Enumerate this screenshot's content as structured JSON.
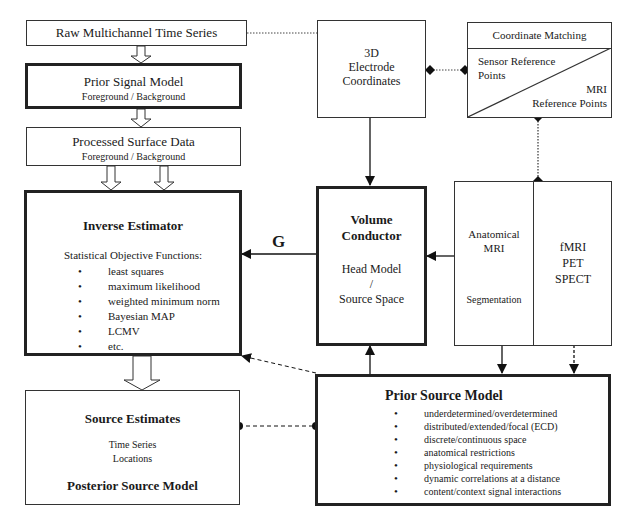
{
  "raw_series": {
    "label": "Raw Multichannel Time Series"
  },
  "prior_signal": {
    "title": "Prior Signal Model",
    "subtitle": "Foreground / Background"
  },
  "processed": {
    "title": "Processed Surface Data",
    "subtitle": "Foreground / Background"
  },
  "inverse": {
    "title": "Inverse Estimator",
    "subtitle": "Statistical Objective Functions:",
    "items": [
      "least squares",
      "maximum likelihood",
      "weighted minimum norm",
      "Bayesian MAP",
      "LCMV",
      "etc."
    ]
  },
  "g_label": "G",
  "electrode": {
    "line1": "3D",
    "line2": "Electrode",
    "line3": "Coordinates"
  },
  "coord_matching": {
    "title": "Coordinate Matching",
    "sensor_line1": "Sensor Reference",
    "sensor_line2": "Points",
    "mri_line1": "MRI",
    "mri_line2": "Reference Points"
  },
  "volume": {
    "title1": "Volume",
    "title2": "Conductor",
    "line1": "Head Model",
    "line2": "/",
    "line3": "Source Space"
  },
  "anatomical": {
    "line1": "Anatomical",
    "line2": "MRI",
    "line3": "Segmentation"
  },
  "functional": {
    "line1": "fMRI",
    "line2": "PET",
    "line3": "SPECT"
  },
  "source_estimates": {
    "title": "Source Estimates",
    "line1": "Time Series",
    "line2": "Locations",
    "footer": "Posterior Source Model"
  },
  "prior_source": {
    "title": "Prior Source Model",
    "items": [
      "underdetermined/overdetermined",
      "distributed/extended/focal (ECD)",
      "discrete/continuous space",
      "anatomical restrictions",
      "physiological requirements",
      "dynamic correlations at a distance",
      "content/context signal interactions"
    ]
  }
}
